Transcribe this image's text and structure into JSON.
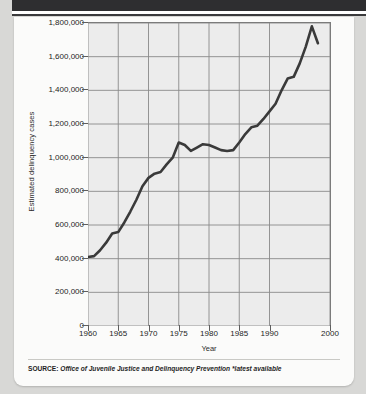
{
  "figure": {
    "source_prefix": "SOURCE:",
    "source_text": "Office of Juvenile Justice and Delinquency Prevention *latest available"
  },
  "chart_data": {
    "type": "line",
    "title": "",
    "xlabel": "Year",
    "ylabel": "Estimated delinquency cases",
    "xlim": [
      1960,
      2000
    ],
    "ylim": [
      0,
      1800000
    ],
    "grid": true,
    "legend": "none",
    "line_color": "#3a3a3a",
    "plot_background": "#ececec",
    "grid_color": "#8a8a8a",
    "xticks": [
      1960,
      1965,
      1970,
      1975,
      1980,
      1985,
      1990,
      2000
    ],
    "xtick_labels": [
      "1960",
      "1965",
      "1970",
      "1975",
      "1980",
      "1985",
      "1990",
      "2000"
    ],
    "yticks": [
      0,
      200000,
      400000,
      600000,
      800000,
      1000000,
      1200000,
      1400000,
      1600000,
      1800000
    ],
    "ytick_labels": [
      "0",
      "200,000",
      "400,000",
      "600,000",
      "800,000",
      "1,000,000",
      "1,200,000",
      "1,400,000",
      "1,600,000",
      "1,800,000"
    ],
    "x": [
      1960,
      1961,
      1962,
      1963,
      1964,
      1965,
      1966,
      1967,
      1968,
      1969,
      1970,
      1971,
      1972,
      1973,
      1974,
      1975,
      1976,
      1977,
      1978,
      1979,
      1980,
      1981,
      1982,
      1983,
      1984,
      1985,
      1986,
      1987,
      1988,
      1989,
      1990,
      1991,
      1992,
      1993,
      1994,
      1995,
      1996,
      1997,
      1998
    ],
    "values": [
      410000,
      415000,
      450000,
      495000,
      550000,
      558000,
      615000,
      680000,
      750000,
      830000,
      880000,
      905000,
      915000,
      960000,
      1000000,
      1090000,
      1075000,
      1040000,
      1060000,
      1080000,
      1075000,
      1060000,
      1045000,
      1040000,
      1045000,
      1090000,
      1140000,
      1180000,
      1190000,
      1230000,
      1275000,
      1320000,
      1400000,
      1470000,
      1480000,
      1560000,
      1660000,
      1780000,
      1680000
    ],
    "series": [
      {
        "name": "Estimated delinquency cases",
        "values": [
          410000,
          415000,
          450000,
          495000,
          550000,
          558000,
          615000,
          680000,
          750000,
          830000,
          880000,
          905000,
          915000,
          960000,
          1000000,
          1090000,
          1075000,
          1040000,
          1060000,
          1080000,
          1075000,
          1060000,
          1045000,
          1040000,
          1045000,
          1090000,
          1140000,
          1180000,
          1190000,
          1230000,
          1275000,
          1320000,
          1400000,
          1470000,
          1480000,
          1560000,
          1660000,
          1780000,
          1680000
        ]
      }
    ],
    "annotations": []
  }
}
